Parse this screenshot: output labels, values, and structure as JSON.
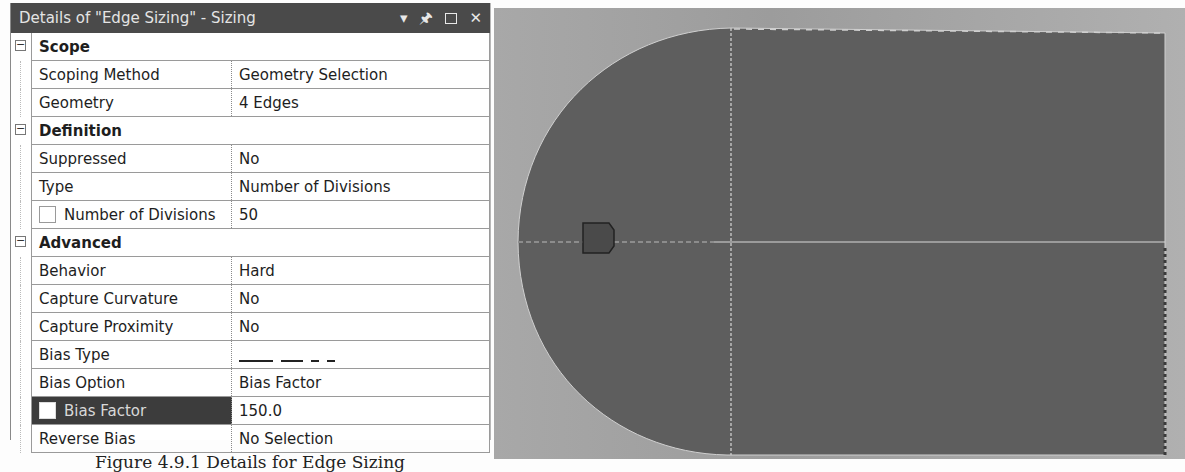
{
  "panel": {
    "title": "Details of \"Edge Sizing\" - Sizing",
    "title_icons": [
      "dropdown-arrow-icon",
      "pin-icon",
      "maximize-icon",
      "close-icon"
    ],
    "categories": [
      {
        "name": "Scope",
        "rows": [
          {
            "label": "Scoping Method",
            "value": "Geometry Selection"
          },
          {
            "label": "Geometry",
            "value": "4 Edges"
          }
        ]
      },
      {
        "name": "Definition",
        "rows": [
          {
            "label": "Suppressed",
            "value": "No"
          },
          {
            "label": "Type",
            "value": "Number of Divisions"
          },
          {
            "label": "Number of Divisions",
            "value": "50",
            "checkbox": true
          }
        ]
      },
      {
        "name": "Advanced",
        "rows": [
          {
            "label": "Behavior",
            "value": "Hard"
          },
          {
            "label": "Capture Curvature",
            "value": "No"
          },
          {
            "label": "Capture Proximity",
            "value": "No"
          },
          {
            "label": "Bias Type",
            "value": "bias-type-glyph"
          },
          {
            "label": "Bias Option",
            "value": "Bias Factor"
          },
          {
            "label": "Bias Factor",
            "value": "150.0",
            "checkbox": true,
            "selected": true
          },
          {
            "label": "Reverse Bias",
            "value": "No Selection"
          }
        ]
      }
    ]
  },
  "caption": "Figure 4.9.1 Details for Edge Sizing",
  "viewport": {
    "background": "#a8a8a8",
    "body_color": "#5e5e5e",
    "edge_color": "#d8d8d8",
    "marker_color": "#4a4a4a"
  }
}
